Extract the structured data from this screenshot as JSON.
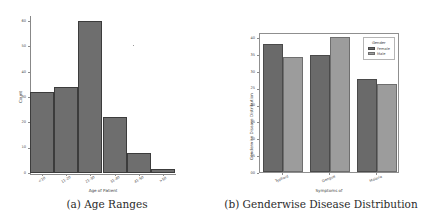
{
  "figure": {
    "panels": [
      {
        "caption": "(a) Age Ranges",
        "chart_data": {
          "type": "bar",
          "title": "",
          "xlabel": "Age of Patient",
          "ylabel": "Count",
          "categories": [
            "<10",
            "11-20",
            "21-30",
            "31-40",
            "41-50",
            ">50"
          ],
          "values": [
            32,
            34,
            60,
            22,
            8,
            1.5
          ],
          "yticks": [
            "0",
            "10",
            "20",
            "30",
            "40",
            "50",
            "60"
          ],
          "ylim": [
            0,
            62
          ],
          "grid": false,
          "legend": null,
          "bar_color": "#6e6e6e",
          "edge_color": "#3c3c3c"
        }
      },
      {
        "caption": "(b) Genderwise Disease Distribution",
        "chart_data": {
          "type": "bar",
          "title": "",
          "xlabel": "Symptoms of",
          "ylabel": "Genderwise Disease Distribution",
          "categories": [
            "Typhoid",
            "Dengue",
            "Malaria"
          ],
          "series": [
            {
              "name": "Female",
              "values": [
                38,
                34.7,
                27.7
              ],
              "color": "#6a6a6a"
            },
            {
              "name": "Male",
              "values": [
                34,
                40,
                26
              ],
              "color": "#9c9c9c"
            }
          ],
          "yticks": [
            "00",
            "05",
            "10",
            "15",
            "20",
            "25",
            "30",
            "35",
            "40"
          ],
          "ylim": [
            0,
            41.5
          ],
          "grid": false,
          "legend": {
            "title": "Gender",
            "position": "upper right"
          }
        }
      }
    ]
  }
}
